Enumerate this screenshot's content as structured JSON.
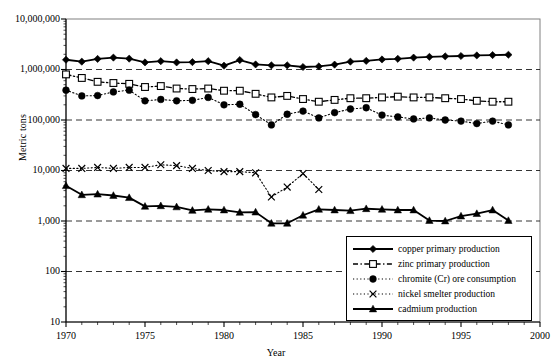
{
  "chart_data": {
    "type": "line",
    "title": "",
    "xlabel": "Year",
    "ylabel": "Metric tons",
    "yscale": "log",
    "ylim": [
      10,
      10000000
    ],
    "xlim": [
      1970,
      2000
    ],
    "grid": "horizontal-dashed",
    "legend_position": "bottom-right",
    "ytick_labels": [
      "10,000,000",
      "1,000,000",
      "100,000",
      "10,000",
      "1,000",
      "100",
      "10"
    ],
    "ytick_values": [
      10000000,
      1000000,
      100000,
      10000,
      1000,
      100,
      10
    ],
    "xtick_labels": [
      "1970",
      "1975",
      "1980",
      "1985",
      "1990",
      "1995",
      "2000"
    ],
    "xtick_values": [
      1970,
      1975,
      1980,
      1985,
      1990,
      1995,
      2000
    ],
    "x": [
      1970,
      1971,
      1972,
      1973,
      1974,
      1975,
      1976,
      1977,
      1978,
      1979,
      1980,
      1981,
      1982,
      1983,
      1984,
      1985,
      1986,
      1987,
      1988,
      1989,
      1990,
      1991,
      1992,
      1993,
      1994,
      1995,
      1996,
      1997,
      1998
    ],
    "series": [
      {
        "name": "copper primary production",
        "marker": "diamond",
        "line": "solid",
        "color": "#000000",
        "values": [
          1560000,
          1430000,
          1620000,
          1720000,
          1640000,
          1380000,
          1460000,
          1380000,
          1400000,
          1460000,
          1190000,
          1540000,
          1260000,
          1210000,
          1210000,
          1120000,
          1150000,
          1250000,
          1430000,
          1480000,
          1580000,
          1630000,
          1720000,
          1780000,
          1820000,
          1850000,
          1900000,
          1930000,
          1960000
        ]
      },
      {
        "name": "zinc primary production",
        "marker": "square-open",
        "line": "dash-dot",
        "color": "#000000",
        "values": [
          800000,
          680000,
          570000,
          540000,
          520000,
          450000,
          470000,
          420000,
          410000,
          420000,
          380000,
          380000,
          330000,
          280000,
          300000,
          260000,
          230000,
          250000,
          270000,
          270000,
          280000,
          290000,
          280000,
          280000,
          270000,
          260000,
          240000,
          230000,
          230000
        ]
      },
      {
        "name": "chromite (Cr) ore consumption",
        "marker": "circle-filled",
        "line": "dotted",
        "color": "#000000",
        "values": [
          390000,
          300000,
          305000,
          360000,
          390000,
          240000,
          255000,
          240000,
          245000,
          280000,
          200000,
          205000,
          128000,
          80000,
          130000,
          150000,
          110000,
          140000,
          165000,
          175000,
          125000,
          115000,
          105000,
          110000,
          100000,
          95000,
          85000,
          95000,
          80000
        ]
      },
      {
        "name": "nickel smelter production",
        "marker": "cross",
        "line": "dotted",
        "color": "#000000",
        "values": [
          11000,
          11000,
          11500,
          11000,
          11500,
          11500,
          13000,
          12500,
          11000,
          10000,
          9500,
          9500,
          9000,
          3000,
          4700,
          8700,
          4200,
          null,
          null,
          null,
          null,
          null,
          null,
          null,
          null,
          null,
          null,
          null,
          null
        ]
      },
      {
        "name": "cadmium production",
        "marker": "triangle-filled",
        "line": "solid",
        "color": "#000000",
        "values": [
          5000,
          3300,
          3400,
          3200,
          2900,
          1950,
          2000,
          1900,
          1620,
          1700,
          1650,
          1480,
          1500,
          900,
          900,
          1300,
          1700,
          1650,
          1600,
          1750,
          1700,
          1650,
          1650,
          1020,
          1000,
          1250,
          1400,
          1650,
          1020
        ]
      }
    ]
  },
  "axis": {
    "ylabel": "Metric tons",
    "xlabel": "Year"
  },
  "legend": {
    "items": [
      {
        "label": "copper primary production",
        "key": "solid-diamond"
      },
      {
        "label": "zinc primary production",
        "key": "dashdot-square"
      },
      {
        "label": "chromite (Cr) ore consumption",
        "key": "dotted-circle"
      },
      {
        "label": "nickel smelter production",
        "key": "dotted-cross"
      },
      {
        "label": "cadmium production",
        "key": "solid-triangle"
      }
    ]
  }
}
